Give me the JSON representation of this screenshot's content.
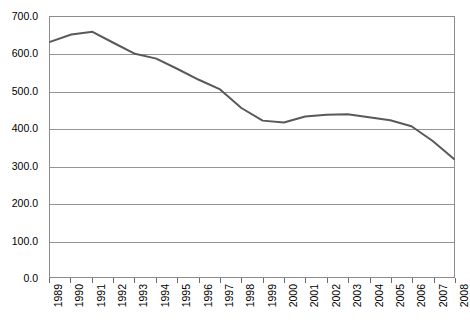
{
  "chart_data": {
    "type": "line",
    "title": "",
    "subtitle": "",
    "xlabel": "",
    "ylabel": "",
    "categories": [
      "1989",
      "1990",
      "1991",
      "1992",
      "1993",
      "1994",
      "1995",
      "1996",
      "1997",
      "1998",
      "1999",
      "2000",
      "2001",
      "2002",
      "2003",
      "2004",
      "2005",
      "2006",
      "2007",
      "2008"
    ],
    "x": [
      1989,
      1990,
      1991,
      1992,
      1993,
      1994,
      1995,
      1996,
      1997,
      1998,
      1999,
      2000,
      2001,
      2002,
      2003,
      2004,
      2005,
      2006,
      2007,
      2008
    ],
    "values": [
      633,
      653,
      660,
      630,
      601,
      588,
      560,
      531,
      505,
      455,
      421,
      416,
      432,
      437,
      438,
      430,
      422,
      406,
      366,
      318
    ],
    "series": [
      {
        "name": "series-1",
        "values": [
          633,
          653,
          660,
          630,
          601,
          588,
          560,
          531,
          505,
          455,
          421,
          416,
          432,
          437,
          438,
          430,
          422,
          406,
          366,
          318
        ],
        "color": "#595959",
        "line_width": 2
      }
    ],
    "ylim": [
      0,
      700
    ],
    "xlim": [
      1989,
      2008
    ],
    "yticks": [
      0,
      100,
      200,
      300,
      400,
      500,
      600,
      700
    ],
    "ytick_labels": [
      "0.0",
      "100.0",
      "200.0",
      "300.0",
      "400.0",
      "500.0",
      "600.0",
      "700.0"
    ],
    "xtick_labels": [
      "1989",
      "1990",
      "1991",
      "1992",
      "1993",
      "1994",
      "1995",
      "1996",
      "1997",
      "1998",
      "1999",
      "2000",
      "2001",
      "2002",
      "2003",
      "2004",
      "2005",
      "2006",
      "2007",
      "2008"
    ],
    "xtick_rotation": -90,
    "grid": true,
    "grid_axis": "y",
    "grid_color": "#949494",
    "legend": false,
    "legend_position": "none",
    "plot_border_color": "#8c8c8c",
    "background_color": "#ffffff",
    "markers": false,
    "annotations": []
  }
}
